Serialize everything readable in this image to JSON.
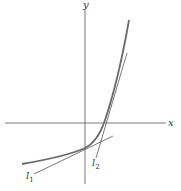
{
  "figure": {
    "axes": {
      "x_label": "x",
      "y_label": "y"
    },
    "curve": {
      "description": "exponential-like increasing convex curve",
      "color": "#6a6a6a"
    },
    "tangents": [
      {
        "label": "l",
        "subscript": "1",
        "color": "#555555"
      },
      {
        "label": "l",
        "subscript": "2",
        "color": "#555555"
      }
    ]
  }
}
